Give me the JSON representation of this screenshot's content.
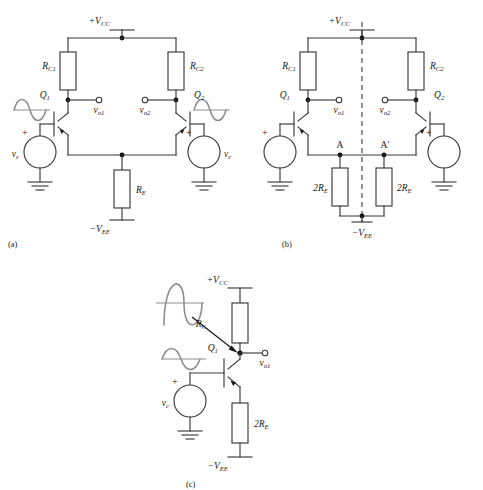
{
  "figure": {
    "background": "#ffffff",
    "wire_color": "#3a3a3a",
    "sine_color": "#8e8e8e",
    "node_color": "#111111"
  },
  "panels": [
    {
      "id": "a",
      "caption": "(a)",
      "description": "Differential pair with common-mode sources and shared emitter resistor R_E",
      "labels": {
        "supply_pos": "+V",
        "supply_pos_sub": "CC",
        "supply_neg": "−V",
        "supply_neg_sub": "EE",
        "rc1": "R",
        "rc1_sub": "C1",
        "rc2": "R",
        "rc2_sub": "C2",
        "re": "R",
        "re_sub": "E",
        "q1": "Q",
        "q1_sub": "1",
        "q2": "Q",
        "q2_sub": "2",
        "vo1": "v",
        "vo1_sub": "o1",
        "vo2": "v",
        "vo2_sub": "o2",
        "vc_left": "v",
        "vc_left_sub": "c",
        "vc_right": "v",
        "vc_right_sub": "c",
        "plus_left": "+",
        "plus_right": "+"
      }
    },
    {
      "id": "b",
      "caption": "(b)",
      "description": "Same circuit with R_E split into two 2R_E halves and a symmetry axis shown dashed",
      "labels": {
        "supply_pos": "+V",
        "supply_pos_sub": "CC",
        "supply_neg": "−V",
        "supply_neg_sub": "EE",
        "rc1": "R",
        "rc1_sub": "C1",
        "rc2": "R",
        "rc2_sub": "C2",
        "re_left": "2R",
        "re_left_sub": "E",
        "re_right": "2R",
        "re_right_sub": "E",
        "q1": "Q",
        "q1_sub": "1",
        "q2": "Q",
        "q2_sub": "2",
        "vo1": "v",
        "vo1_sub": "o1",
        "vo2": "v",
        "vo2_sub": "o2",
        "node_a": "A",
        "node_a_prime": "A′",
        "plus_left": "+",
        "plus_right": "+"
      }
    },
    {
      "id": "c",
      "caption": "(c)",
      "description": "Common-mode half circuit: single transistor with R_C and 2R_E",
      "labels": {
        "supply_pos": "+V",
        "supply_pos_sub": "CC",
        "supply_neg": "−V",
        "supply_neg_sub": "EE",
        "rc": "R",
        "rc_sub": "C",
        "re": "2R",
        "re_sub": "E",
        "q1": "Q",
        "q1_sub": "1",
        "vo1": "v",
        "vo1_sub": "o1",
        "vc": "v",
        "vc_sub": "c",
        "plus": "+"
      }
    }
  ]
}
